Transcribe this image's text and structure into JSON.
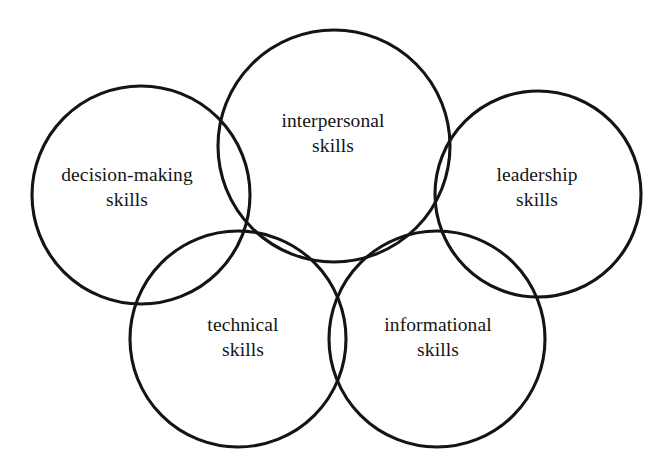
{
  "diagram": {
    "type": "venn-circles",
    "background_color": "#ffffff",
    "stroke_color": "#141414",
    "stroke_width": 3.1,
    "text_color": "#151515",
    "canvas": {
      "width": 666,
      "height": 474
    },
    "circles": [
      {
        "id": "decision-making",
        "label_line1": "decision-making",
        "label_line2": "skills",
        "cx": 141,
        "cy": 195,
        "r": 109,
        "label_x": 127,
        "label_y": 188
      },
      {
        "id": "interpersonal",
        "label_line1": "interpersonal",
        "label_line2": "skills",
        "cx": 334,
        "cy": 146,
        "r": 116,
        "label_x": 333,
        "label_y": 134
      },
      {
        "id": "leadership",
        "label_line1": "leadership",
        "label_line2": "skills",
        "cx": 538,
        "cy": 194,
        "r": 103,
        "label_x": 537,
        "label_y": 188
      },
      {
        "id": "technical",
        "label_line1": "technical",
        "label_line2": "skills",
        "cx": 238,
        "cy": 339,
        "r": 108,
        "label_x": 243,
        "label_y": 338
      },
      {
        "id": "informational",
        "label_line1": "informational",
        "label_line2": "skills",
        "cx": 437,
        "cy": 339,
        "r": 108,
        "label_x": 438,
        "label_y": 338
      }
    ]
  }
}
